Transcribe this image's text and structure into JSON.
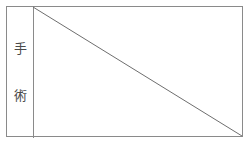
{
  "figure": {
    "title": "",
    "background_color": "#ffffff",
    "line_color": "#8a8a8a",
    "text_color": "#4a4a4a"
  },
  "label_column": {
    "name": "surgery-label",
    "text": "手術",
    "orientation": "vertical",
    "characters": [
      {
        "char": "手"
      },
      {
        "char": "術"
      }
    ]
  },
  "chart_data": {
    "type": "line",
    "title": "",
    "xlabel": "",
    "ylabel": "手術",
    "grid": false,
    "legend": null,
    "xlim": [
      0,
      1
    ],
    "ylim": [
      0,
      1
    ],
    "series": [
      {
        "name": "diagonal",
        "color": "#6e6e6e",
        "x": [
          0,
          1
        ],
        "y": [
          1,
          0
        ]
      }
    ],
    "annotations": []
  },
  "frame": {
    "name": "outer-rectangle",
    "border_color": "#8a8a8a"
  },
  "divider": {
    "name": "column-divider",
    "color": "#8a8a8a"
  }
}
